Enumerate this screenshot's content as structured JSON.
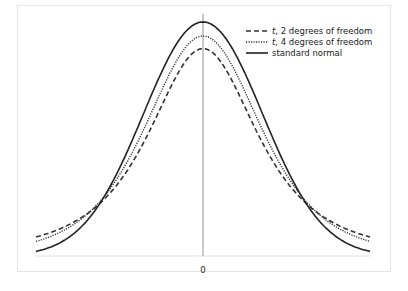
{
  "chart_data": {
    "type": "line",
    "title": "",
    "xlabel": "",
    "ylabel": "",
    "x_ticks": [
      "0"
    ],
    "xlim": [
      -2.8,
      2.8
    ],
    "grid": false,
    "legend_position": "upper right",
    "series": [
      {
        "name": "t, 2 degrees of freedom",
        "style": "dashed",
        "df": 2
      },
      {
        "name": "t, 4 degrees of freedom",
        "style": "dotted",
        "df": 4
      },
      {
        "name": "standard normal",
        "style": "solid",
        "df": null
      }
    ],
    "peak_values": {
      "t2": 0.354,
      "t4": 0.375,
      "normal": 0.399
    }
  },
  "legend": {
    "items": [
      {
        "italic": "t",
        "rest": ", 2 degrees of freedom"
      },
      {
        "italic": "t",
        "rest": ", 4 degrees of freedom"
      },
      {
        "italic": "",
        "rest": "standard normal"
      }
    ]
  },
  "axis": {
    "zero_label": "0"
  }
}
